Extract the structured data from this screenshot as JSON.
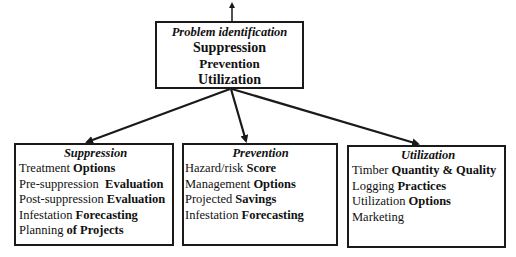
{
  "top": {
    "title": "Problem identification",
    "items": [
      "Suppression",
      "Prevention",
      "Utilization"
    ]
  },
  "boxes": [
    {
      "title": "Suppression",
      "items": [
        {
          "normal": "Treatment ",
          "bold": "Options"
        },
        {
          "normal": "Pre-suppression  ",
          "bold": "Evaluation"
        },
        {
          "normal": "Post-suppression ",
          "bold": "Evaluation"
        },
        {
          "normal": "Infestation ",
          "bold": "Forecasting"
        },
        {
          "normal": "Planning ",
          "bold": "of Projects"
        }
      ]
    },
    {
      "title": "Prevention",
      "items": [
        {
          "normal": "Hazard/risk ",
          "bold": "Score"
        },
        {
          "normal": "Management ",
          "bold": "Options"
        },
        {
          "normal": "Projected ",
          "bold": "Savings"
        },
        {
          "normal": "Infestation ",
          "bold": "Forecasting"
        }
      ]
    },
    {
      "title": "Utilization",
      "items": [
        {
          "normal": "Timber ",
          "bold": "Quantity & Quality"
        },
        {
          "normal": "Logging ",
          "bold": "Practices"
        },
        {
          "normal": "Utilization ",
          "bold": "Options"
        },
        {
          "normal": "Marketing",
          "bold": ""
        }
      ]
    }
  ],
  "colors": {
    "line": "#1a1a1a",
    "background": "#ffffff"
  }
}
